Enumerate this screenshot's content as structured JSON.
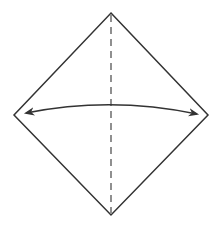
{
  "diagram": {
    "type": "origami-fold-step",
    "colors": {
      "background": "#ffffff",
      "stroke": "#333333",
      "dashed": "#555555",
      "arrow": "#333333"
    },
    "shape": {
      "name": "diamond-square",
      "vertices": {
        "top": [
          111,
          13
        ],
        "right": [
          208,
          115
        ],
        "bottom": [
          111,
          215
        ],
        "left": [
          14,
          115
        ]
      }
    },
    "fold_line": {
      "style": "dashed",
      "from": [
        111,
        13
      ],
      "to": [
        111,
        215
      ]
    },
    "arrow": {
      "style": "double-headed-arc",
      "from": [
        26,
        113
      ],
      "control": [
        111,
        96
      ],
      "to": [
        197,
        114
      ]
    }
  }
}
